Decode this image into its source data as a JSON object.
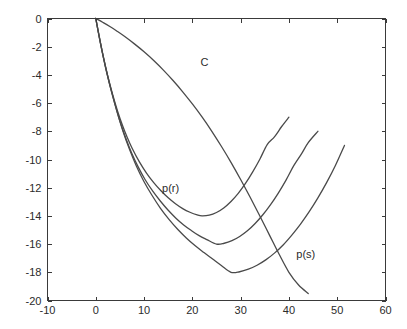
{
  "chart_data": {
    "type": "line",
    "title": "",
    "xlabel": "",
    "ylabel": "",
    "xlim": [
      -10,
      60
    ],
    "ylim": [
      -20,
      0
    ],
    "xticks": [
      -10,
      0,
      10,
      20,
      30,
      40,
      50,
      60
    ],
    "yticks": [
      -20,
      -18,
      -16,
      -14,
      -12,
      -10,
      -8,
      -6,
      -4,
      -2,
      0
    ],
    "xtick_labels": [
      "-10",
      "0",
      "10",
      "20",
      "30",
      "40",
      "50",
      "60"
    ],
    "ytick_labels": [
      "-20",
      "-18",
      "-16",
      "-14",
      "-12",
      "-10",
      "-8",
      "-6",
      "-4",
      "-2",
      "0"
    ],
    "grid": false,
    "legend": "none",
    "line_color": "#4a4a4a",
    "axis_color": "#3a3a3a",
    "background": "#ffffff",
    "annotations": [
      {
        "text": "C",
        "x": 22.5,
        "y": -3.1
      },
      {
        "text": "p(r)",
        "x": 15.5,
        "y": -12.0
      },
      {
        "text": "p(s)",
        "x": 43.5,
        "y": -16.7
      }
    ],
    "series": [
      {
        "name": "C",
        "comment": "monotone descending arc from origin",
        "points": [
          [
            0.0,
            0.0
          ],
          [
            1.5,
            -0.28
          ],
          [
            3.0,
            -0.58
          ],
          [
            4.5,
            -0.92
          ],
          [
            6.0,
            -1.28
          ],
          [
            8.0,
            -1.8
          ],
          [
            10.0,
            -2.36
          ],
          [
            12.0,
            -2.98
          ],
          [
            14.0,
            -3.66
          ],
          [
            16.0,
            -4.4
          ],
          [
            18.0,
            -5.2
          ],
          [
            20.0,
            -6.06
          ],
          [
            22.0,
            -6.98
          ],
          [
            24.0,
            -7.98
          ],
          [
            26.0,
            -9.06
          ],
          [
            28.0,
            -10.2
          ],
          [
            30.0,
            -11.42
          ],
          [
            32.0,
            -12.7
          ],
          [
            34.0,
            -14.02
          ],
          [
            36.0,
            -15.38
          ],
          [
            38.0,
            -16.74
          ],
          [
            40.0,
            -18.0
          ],
          [
            42.0,
            -18.9
          ],
          [
            44.0,
            -19.5
          ]
        ]
      },
      {
        "name": "p(r) upper",
        "comment": "U-curve, minimum about (22, -14), right end about (40, -7)",
        "points": [
          [
            0.0,
            0.0
          ],
          [
            0.8,
            -1.45
          ],
          [
            1.6,
            -2.78
          ],
          [
            2.5,
            -4.1
          ],
          [
            3.5,
            -5.4
          ],
          [
            4.5,
            -6.55
          ],
          [
            5.5,
            -7.55
          ],
          [
            6.5,
            -8.42
          ],
          [
            7.5,
            -9.18
          ],
          [
            9.0,
            -10.15
          ],
          [
            10.5,
            -10.96
          ],
          [
            12.0,
            -11.64
          ],
          [
            13.5,
            -12.22
          ],
          [
            15.0,
            -12.72
          ],
          [
            16.5,
            -13.14
          ],
          [
            18.0,
            -13.48
          ],
          [
            19.5,
            -13.74
          ],
          [
            21.0,
            -13.93
          ],
          [
            22.0,
            -14.0
          ],
          [
            23.5,
            -13.95
          ],
          [
            25.0,
            -13.76
          ],
          [
            26.5,
            -13.44
          ],
          [
            28.0,
            -12.98
          ],
          [
            29.5,
            -12.4
          ],
          [
            31.0,
            -11.7
          ],
          [
            32.5,
            -10.88
          ],
          [
            34.0,
            -9.96
          ],
          [
            35.5,
            -8.94
          ],
          [
            37.0,
            -8.4
          ],
          [
            38.5,
            -7.66
          ],
          [
            40.0,
            -7.0
          ]
        ]
      },
      {
        "name": "p(r) middle",
        "comment": "U-curve, minimum about (25, -16), right end about (46, -8)",
        "points": [
          [
            0.0,
            0.0
          ],
          [
            0.9,
            -1.62
          ],
          [
            1.8,
            -3.1
          ],
          [
            2.8,
            -4.58
          ],
          [
            3.9,
            -6.0
          ],
          [
            5.0,
            -7.28
          ],
          [
            6.2,
            -8.48
          ],
          [
            7.4,
            -9.52
          ],
          [
            8.8,
            -10.54
          ],
          [
            10.2,
            -11.42
          ],
          [
            11.8,
            -12.25
          ],
          [
            13.4,
            -12.96
          ],
          [
            15.0,
            -13.6
          ],
          [
            16.6,
            -14.16
          ],
          [
            18.2,
            -14.64
          ],
          [
            19.8,
            -15.04
          ],
          [
            21.4,
            -15.4
          ],
          [
            23.0,
            -15.68
          ],
          [
            25.0,
            -16.0
          ],
          [
            26.6,
            -15.94
          ],
          [
            28.2,
            -15.76
          ],
          [
            29.8,
            -15.46
          ],
          [
            31.4,
            -15.06
          ],
          [
            33.0,
            -14.54
          ],
          [
            34.6,
            -13.92
          ],
          [
            36.2,
            -13.2
          ],
          [
            37.8,
            -12.38
          ],
          [
            39.4,
            -11.46
          ],
          [
            41.0,
            -10.44
          ],
          [
            42.6,
            -9.6
          ],
          [
            44.0,
            -8.8
          ],
          [
            46.0,
            -8.0
          ]
        ]
      },
      {
        "name": "p(s) lower",
        "comment": "U-curve, minimum about (28, -18), right end about (51.5, -9)",
        "points": [
          [
            0.0,
            0.0
          ],
          [
            1.0,
            -1.8
          ],
          [
            2.0,
            -3.44
          ],
          [
            3.2,
            -5.1
          ],
          [
            4.4,
            -6.6
          ],
          [
            5.6,
            -7.96
          ],
          [
            7.0,
            -9.3
          ],
          [
            8.4,
            -10.46
          ],
          [
            10.0,
            -11.58
          ],
          [
            11.6,
            -12.52
          ],
          [
            13.4,
            -13.46
          ],
          [
            15.2,
            -14.26
          ],
          [
            17.0,
            -14.96
          ],
          [
            18.8,
            -15.58
          ],
          [
            20.6,
            -16.12
          ],
          [
            22.4,
            -16.6
          ],
          [
            24.2,
            -17.06
          ],
          [
            26.0,
            -17.52
          ],
          [
            28.0,
            -18.0
          ],
          [
            29.8,
            -17.96
          ],
          [
            31.6,
            -17.78
          ],
          [
            33.4,
            -17.5
          ],
          [
            35.2,
            -17.12
          ],
          [
            37.0,
            -16.64
          ],
          [
            38.8,
            -16.06
          ],
          [
            40.6,
            -15.36
          ],
          [
            42.4,
            -14.58
          ],
          [
            44.2,
            -13.7
          ],
          [
            46.0,
            -12.72
          ],
          [
            47.8,
            -11.64
          ],
          [
            49.6,
            -10.44
          ],
          [
            51.5,
            -9.0
          ]
        ]
      }
    ]
  }
}
